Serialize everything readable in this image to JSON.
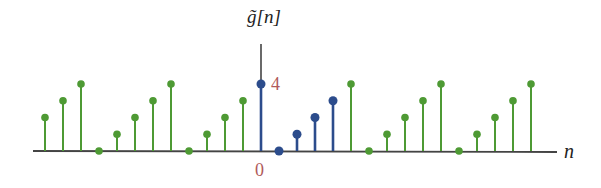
{
  "chart_data": {
    "type": "stem",
    "title": "",
    "ylabel": "g̃[n]",
    "xlabel": "n",
    "x_tick_labels": [
      {
        "n": 0,
        "label": "0"
      }
    ],
    "y_tick_labels": [
      {
        "value": 4,
        "label": "4"
      }
    ],
    "period": 5,
    "one_period": {
      "n": [
        0,
        1,
        2,
        3,
        4
      ],
      "values": [
        4,
        0,
        1,
        2,
        3
      ]
    },
    "x": [
      -12,
      -11,
      -10,
      -9,
      -8,
      -7,
      -6,
      -5,
      -4,
      -3,
      -2,
      -1,
      0,
      1,
      2,
      3,
      4,
      5,
      6,
      7,
      8,
      9,
      10,
      11,
      12,
      13,
      14,
      15
    ],
    "values": [
      2,
      3,
      4,
      0,
      1,
      2,
      3,
      4,
      0,
      1,
      2,
      3,
      4,
      0,
      1,
      2,
      3,
      4,
      0,
      1,
      2,
      3,
      4,
      0,
      1,
      2,
      3,
      4
    ],
    "highlight_range": [
      0,
      4
    ],
    "colors": {
      "periodic": "#4e9a34",
      "highlight": "#2c4c8c",
      "axis": "#444444",
      "tick_label": "#b05a5a"
    },
    "grid": false,
    "legend": null
  },
  "labels": {
    "ylabel": "g̃[n]",
    "xlabel": "n",
    "zero": "0",
    "four": "4"
  }
}
